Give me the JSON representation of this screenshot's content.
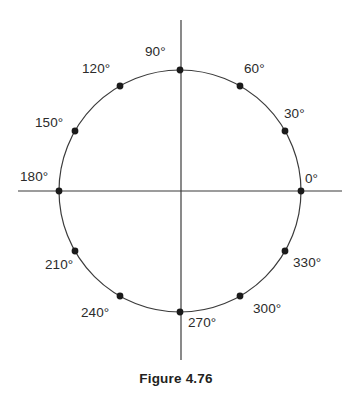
{
  "figure": {
    "caption": "Figure 4.76",
    "width": 352,
    "height": 396
  },
  "chart_data": {
    "type": "scatter",
    "title": "Figure 4.76",
    "subtitle": "",
    "xlabel": "",
    "ylabel": "",
    "grid": false,
    "legend": false,
    "axes": {
      "horizontal": {
        "y": 191,
        "x_start": 18,
        "x_end": 342
      },
      "vertical": {
        "x": 181,
        "y_start": 20,
        "y_end": 360
      }
    },
    "circle": {
      "cx": 180,
      "cy": 191,
      "r": 121,
      "stroke": "#3b3b3b",
      "stroke_width": 1.2
    },
    "point_color": "#1a1a1a",
    "point_radius": 3.4,
    "categories": [
      "0°",
      "30°",
      "60°",
      "90°",
      "120°",
      "150°",
      "180°",
      "210°",
      "240°",
      "270°",
      "300°",
      "330°"
    ],
    "values": [
      0,
      30,
      60,
      90,
      120,
      150,
      180,
      210,
      240,
      270,
      300,
      330
    ],
    "points": [
      {
        "name": "point-0",
        "label": "0°",
        "angle": 0,
        "px": 301,
        "py": 191,
        "lx": 305,
        "ly": 172
      },
      {
        "name": "point-30",
        "label": "30°",
        "angle": 30,
        "px": 285,
        "py": 131,
        "lx": 284,
        "ly": 107
      },
      {
        "name": "point-60",
        "label": "60°",
        "angle": 60,
        "px": 240,
        "py": 86,
        "lx": 244,
        "ly": 62
      },
      {
        "name": "point-90",
        "label": "90°",
        "angle": 90,
        "px": 180,
        "py": 70,
        "lx": 145,
        "ly": 45
      },
      {
        "name": "point-120",
        "label": "120°",
        "angle": 120,
        "px": 120,
        "py": 86,
        "lx": 82,
        "ly": 62
      },
      {
        "name": "point-150",
        "label": "150°",
        "angle": 150,
        "px": 75,
        "py": 131,
        "lx": 35,
        "ly": 116
      },
      {
        "name": "point-180",
        "label": "180°",
        "angle": 180,
        "px": 59,
        "py": 191,
        "lx": 20,
        "ly": 170
      },
      {
        "name": "point-210",
        "label": "210°",
        "angle": 210,
        "px": 75,
        "py": 251,
        "lx": 45,
        "ly": 258
      },
      {
        "name": "point-240",
        "label": "240°",
        "angle": 240,
        "px": 120,
        "py": 296,
        "lx": 81,
        "ly": 306
      },
      {
        "name": "point-270",
        "label": "270°",
        "angle": 270,
        "px": 180,
        "py": 312,
        "lx": 188,
        "ly": 316
      },
      {
        "name": "point-300",
        "label": "300°",
        "angle": 300,
        "px": 240,
        "py": 296,
        "lx": 253,
        "ly": 302
      },
      {
        "name": "point-330",
        "label": "330°",
        "angle": 330,
        "px": 285,
        "py": 251,
        "lx": 293,
        "ly": 256
      }
    ]
  }
}
